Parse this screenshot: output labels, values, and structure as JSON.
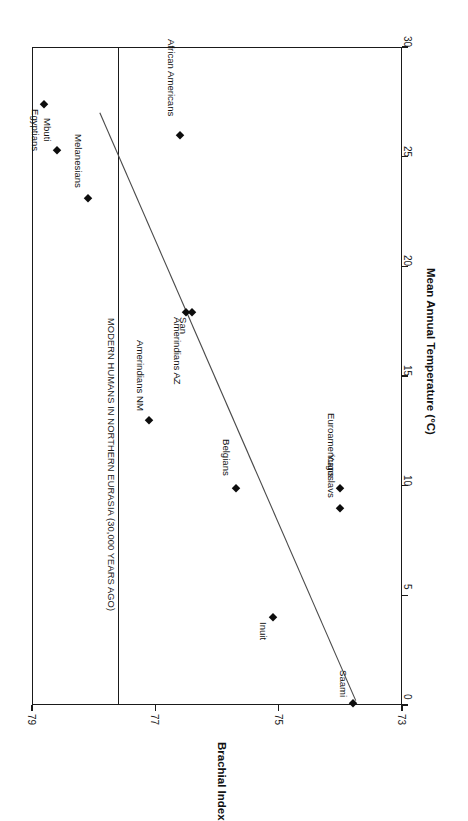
{
  "chart_data": {
    "type": "scatter",
    "title": "",
    "orientation": "rotated-90-clockwise",
    "xlabel": "Mean Annual Temperature (°C)",
    "ylabel": "Brachial Index",
    "xlim": [
      0,
      30
    ],
    "ylim": [
      73,
      79
    ],
    "x_ticks": [
      0,
      5,
      10,
      15,
      20,
      25,
      30
    ],
    "x_tick_labels": [
      "0",
      "5",
      "10",
      "15",
      "20",
      "25",
      "30"
    ],
    "y_ticks": [
      79,
      77,
      75,
      73
    ],
    "y_tick_labels": [
      "79",
      "77",
      "75",
      "73"
    ],
    "y_axis_direction": "descending",
    "grid": false,
    "legend": "none",
    "points": [
      {
        "name": "Egyptians",
        "temp": 27.4,
        "brachial_index": 78.8,
        "label_side": "after"
      },
      {
        "name": "Mbuti",
        "temp": 25.3,
        "brachial_index": 78.6,
        "label_side": "before"
      },
      {
        "name": "Melanesians",
        "temp": 23.1,
        "brachial_index": 78.1,
        "label_side": "before"
      },
      {
        "name": "African Americans",
        "temp": 26.0,
        "brachial_index": 76.6,
        "label_side": "before"
      },
      {
        "name": "Amerindians AZ",
        "temp": 17.9,
        "brachial_index": 76.5,
        "label_side": "after"
      },
      {
        "name": "San",
        "temp": 17.9,
        "brachial_index": 76.4,
        "label_side": "after"
      },
      {
        "name": "Amerindians NM",
        "temp": 13.0,
        "brachial_index": 77.1,
        "label_side": "before"
      },
      {
        "name": "Belgians",
        "temp": 9.9,
        "brachial_index": 75.7,
        "label_side": "before"
      },
      {
        "name": "Euroamericans",
        "temp": 9.9,
        "brachial_index": 74.0,
        "label_side": "before"
      },
      {
        "name": "Yugoslavs",
        "temp": 9.0,
        "brachial_index": 74.0,
        "label_side": "before"
      },
      {
        "name": "Inuit",
        "temp": 4.0,
        "brachial_index": 75.1,
        "label_side": "after"
      },
      {
        "name": "Saami",
        "temp": 0.1,
        "brachial_index": 73.8,
        "label_side": "before"
      }
    ],
    "trend_line": {
      "label": "",
      "start": {
        "temp": 0.2,
        "brachial_index": 73.75
      },
      "end": {
        "temp": 27.0,
        "brachial_index": 77.9
      }
    },
    "reference_line": {
      "label": "MODERN HUMANS IN NORTHERN EURASIA (30,000 YEARS AGO)",
      "brachial_index": 77.6,
      "orientation": "constant-brachial-index"
    }
  }
}
